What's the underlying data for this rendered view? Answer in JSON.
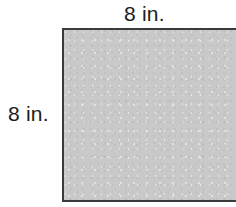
{
  "figure": {
    "type": "square-area-diagram",
    "shape_name": "square",
    "background_color": "#ffffff",
    "fill_color": "#c9c9c9",
    "stroke_color": "#3a3a3a",
    "label_color": "#1c1c1c",
    "labels": {
      "top": "8 in.",
      "left": "8 in."
    },
    "dimensions": {
      "width_value": 8,
      "height_value": 8,
      "unit": "in."
    }
  }
}
